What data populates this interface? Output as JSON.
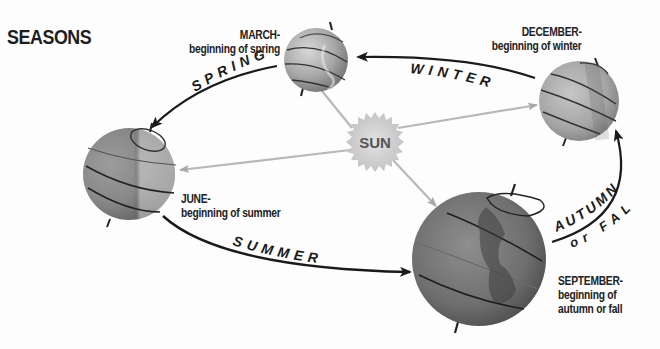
{
  "title": "SEASONS",
  "sun": {
    "label": "SUN"
  },
  "positions": {
    "march": {
      "month": "MARCH-",
      "description": "beginning of spring"
    },
    "december": {
      "month": "DECEMBER-",
      "description": "beginning of winter"
    },
    "june": {
      "month": "JUNE-",
      "description": "beginning of summer"
    },
    "september": {
      "month": "SEPTEMBER-",
      "description_line1": "beginning of",
      "description_line2": "autumn or fall"
    }
  },
  "seasons": {
    "spring": "SPRING",
    "winter": "WINTER",
    "summer": "SUMMER",
    "autumn": "AUTUMN",
    "autumn_alt": "or FALL"
  },
  "colors": {
    "background": "#fdfdfd",
    "globe_light": "#c9c9c9",
    "globe_mid": "#9a9a9a",
    "globe_dark": "#5a5a5a",
    "sun_fill": "#d6d6d6",
    "ray": "#b5b5b5",
    "arrow": "#1a1a1a",
    "text": "#222222"
  }
}
